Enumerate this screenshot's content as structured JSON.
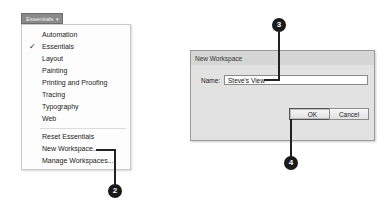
{
  "workspace_switcher": {
    "label": "Essentials",
    "caret": "▾"
  },
  "menu": {
    "items": [
      {
        "label": "Automation",
        "checked": false
      },
      {
        "label": "Essentials",
        "checked": true,
        "check_glyph": "✓"
      },
      {
        "label": "Layout",
        "checked": false
      },
      {
        "label": "Painting",
        "checked": false
      },
      {
        "label": "Printing and Proofing",
        "checked": false
      },
      {
        "label": "Tracing",
        "checked": false
      },
      {
        "label": "Typography",
        "checked": false
      },
      {
        "label": "Web",
        "checked": false
      },
      {
        "label": "Reset Essentials",
        "checked": false
      },
      {
        "label": "New Workspace...",
        "checked": false
      },
      {
        "label": "Manage Workspaces...",
        "checked": false
      }
    ]
  },
  "dialog": {
    "title": "New Workspace",
    "name_label": "Name:",
    "name_value": "Steve's View",
    "ok_label": "OK",
    "cancel_label": "Cancel"
  },
  "callouts": {
    "step2": "2",
    "step3": "3",
    "step4": "4"
  },
  "colors": {
    "callout_bg": "#1a1a1a",
    "dialog_bg": "#e2e2e2",
    "switcher_bg": "#8a8a8a"
  }
}
